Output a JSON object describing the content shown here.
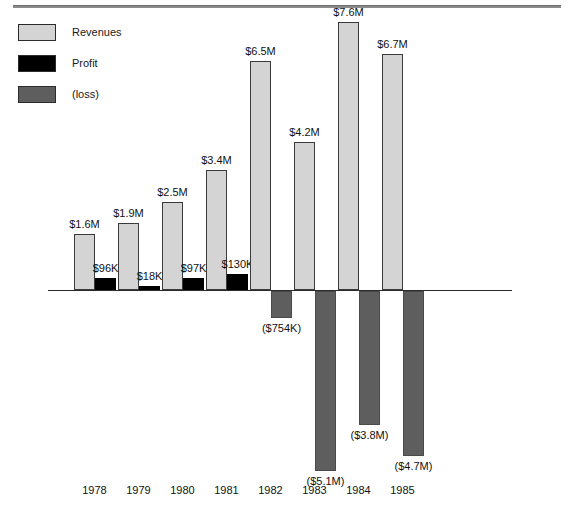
{
  "chart_data": {
    "type": "bar",
    "title": "",
    "subtitle": "",
    "xlabel": "",
    "ylabel": "",
    "grid": false,
    "legend_position": "top-left",
    "categories": [
      "1978",
      "1979",
      "1980",
      "1981",
      "1982",
      "1983",
      "1984",
      "1985"
    ],
    "axis": {
      "zero_line": true,
      "ylim_labels": [
        "($5.1M)",
        "$7.6M"
      ]
    },
    "series": [
      {
        "name": "Revenues",
        "color": "#d4d4d4",
        "values": [
          1.6,
          1.9,
          2.5,
          3.4,
          6.5,
          4.2,
          7.6,
          6.7
        ],
        "labels": [
          "$1.6M",
          "$1.9M",
          "$2.5M",
          "$3.4M",
          "$6.5M",
          "$4.2M",
          "$7.6M",
          "$6.7M"
        ]
      },
      {
        "name": "Profit",
        "color": "#000000",
        "values": [
          0.096,
          0.018,
          0.097,
          0.13,
          null,
          null,
          null,
          null
        ],
        "labels": [
          "$96K",
          "$18K",
          "$97K",
          "$130K",
          "",
          "",
          "",
          ""
        ]
      },
      {
        "name": "(loss)",
        "color": "#5e5e5e",
        "values": [
          null,
          null,
          null,
          null,
          -0.754,
          -5.1,
          -3.8,
          -4.7
        ],
        "labels": [
          "",
          "",
          "",
          "",
          "($754K)",
          "($5.1M)",
          "($3.8M)",
          "($4.7M)"
        ]
      }
    ]
  },
  "legend": {
    "items": [
      {
        "label": "Revenues",
        "swatch": "sw-rev"
      },
      {
        "label": "Profit",
        "swatch": "sw-profit"
      },
      {
        "label": "(loss)",
        "swatch": "sw-loss"
      }
    ]
  },
  "labels": {
    "revenue": {
      "v0": "$1.6M",
      "v1": "$1.9M",
      "v2": "$2.5M",
      "v3": "$3.4M",
      "v4": "$6.5M",
      "v5": "$4.2M",
      "v6": "$7.6M",
      "v7": "$6.7M"
    },
    "profit": {
      "v0": "$96K",
      "v1": "$18K",
      "v2": "$97K",
      "v3": "$130K"
    },
    "loss": {
      "v4": "($754K)",
      "v5": "($5.1M)",
      "v6": "($3.8M)",
      "v7": "($4.7M)"
    },
    "years": {
      "y0": "1978",
      "y1": "1979",
      "y2": "1980",
      "y3": "1981",
      "y4": "1982",
      "y5": "1983",
      "y6": "1984",
      "y7": "1985"
    }
  },
  "colors": {
    "revenue": "#d4d4d4",
    "profit": "#000000",
    "loss": "#5e5e5e",
    "axis": "#2b2b2b",
    "rule": "#8a8a8a",
    "text": "#111111"
  }
}
